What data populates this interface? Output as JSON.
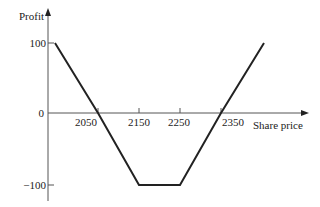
{
  "chart_data": {
    "type": "line",
    "title": "",
    "xlabel": "Share price",
    "ylabel": "Profit",
    "x_ticks": [
      2050,
      2150,
      2250,
      2350
    ],
    "y_ticks": [
      100,
      0,
      -100
    ],
    "x_tick_labels": [
      "2050",
      "2150",
      "2250",
      "2350"
    ],
    "y_tick_labels": [
      "100",
      "0",
      "−100"
    ],
    "grid": false,
    "legend": null,
    "series": [
      {
        "name": "Profit",
        "x": [
          1945,
          2050,
          2150,
          2250,
          2350,
          2455
        ],
        "y": [
          100,
          0,
          -103,
          -103,
          0,
          100
        ]
      }
    ],
    "xlim": [
      1930,
      2500
    ],
    "ylim": [
      -120,
      125
    ]
  },
  "labels": {
    "ylabel": "Profit",
    "xlabel": "Share price",
    "y100": "100",
    "y0": "0",
    "yneg100": "−100",
    "x2050": "2050",
    "x2150": "2150",
    "x2250": "2250",
    "x2350": "2350"
  }
}
